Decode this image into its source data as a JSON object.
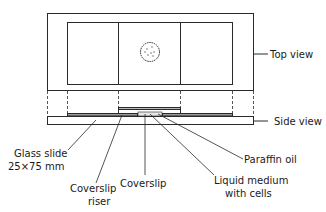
{
  "diagram": {
    "views": {
      "top": "Top view",
      "side": "Side view"
    },
    "labels": {
      "glass_slide_line1": "Glass slide",
      "glass_slide_line2": "25×75 mm",
      "coverslip_riser_line1": "Coverslip",
      "coverslip_riser_line2": "riser",
      "coverslip": "Coverslip",
      "liquid_line1": "Liquid medium",
      "liquid_line2": "with cells",
      "paraffin": "Paraffin oil"
    },
    "colors": {
      "line": "#2a2a2a",
      "fill_gray": "#9a9a9a"
    }
  }
}
